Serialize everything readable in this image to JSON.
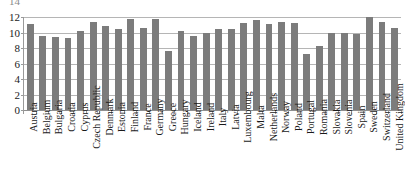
{
  "chart_data": {
    "type": "bar",
    "title": "",
    "subtitle": "",
    "xlabel": "",
    "ylabel": "",
    "grid": true,
    "legend": false,
    "ylim": [
      0,
      12
    ],
    "y_ticks": [
      0,
      2,
      4,
      6,
      8,
      10,
      12
    ],
    "y_tick_labels": [
      "0",
      "2",
      "4",
      "6",
      "8",
      "10",
      "12"
    ],
    "clipped_top_label": "14",
    "bar_color": "#7c7c7c",
    "gridline_color": "#b5b5b5",
    "axis_color": "#9a9a9a",
    "categories": [
      "Austria",
      "Belgium",
      "Bulgaria",
      "Croatia",
      "Cyprus",
      "Czech Republic",
      "Denmark",
      "Estonia",
      "Finland",
      "France",
      "Germany",
      "Greece",
      "Hungary",
      "Iceland",
      "Ireland",
      "Italy",
      "Latvia",
      "Luxembourg",
      "Malta",
      "Netherlands",
      "Norway",
      "Poland",
      "Portugal",
      "Romania",
      "Slovakia",
      "Slovenia",
      "Spain",
      "Sweden",
      "Switzerland",
      "United Kingdom"
    ],
    "values": [
      11.1,
      9.5,
      9.4,
      9.3,
      10.2,
      11.4,
      10.9,
      10.4,
      11.8,
      10.6,
      11.7,
      7.6,
      10.2,
      9.6,
      10.0,
      10.4,
      10.4,
      11.2,
      11.6,
      11.1,
      11.4,
      11.2,
      7.2,
      8.2,
      10.0,
      9.9,
      9.8,
      12.0,
      11.3,
      10.6
    ]
  }
}
